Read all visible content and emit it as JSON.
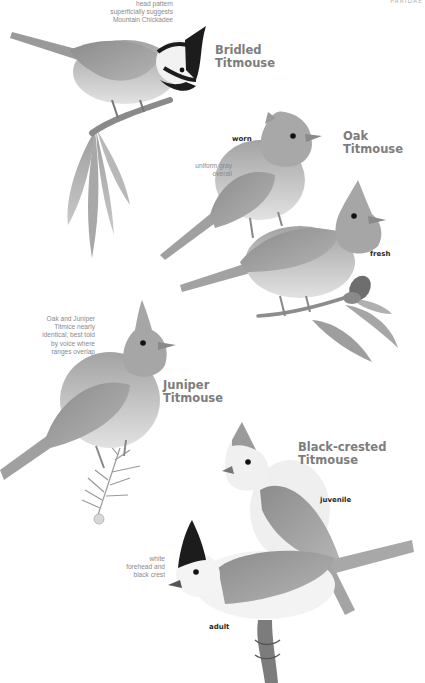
{
  "page": {
    "header_tag": "PARIDAE",
    "palette": {
      "background": "#ffffff",
      "species_label": "#7d7d7d",
      "note_text": "#8a8a8a",
      "plumage_tag": "#2a2a2a",
      "bird_gray": "#9a9a9a",
      "bird_light": "#dcdcdc",
      "black": "#1c1c1c"
    }
  },
  "species": [
    {
      "name": "Bridled\nTitmouse",
      "notes": [
        "head pattern\nsuperficially suggests\nMountain Chickadee"
      ],
      "tags": []
    },
    {
      "name": "Oak\nTitmouse",
      "notes": [
        "uniform gray\noverall"
      ],
      "tags": [
        "worn",
        "fresh"
      ]
    },
    {
      "name": "Juniper\nTitmouse",
      "notes": [
        "Oak and Juniper\nTitmice nearly\nidentical; best told\nby voice where\nranges overlap"
      ],
      "tags": []
    },
    {
      "name": "Black-crested\nTitmouse",
      "notes": [
        "white\nforehead and\nblack crest"
      ],
      "tags": [
        "juvenile",
        "adult"
      ]
    }
  ]
}
